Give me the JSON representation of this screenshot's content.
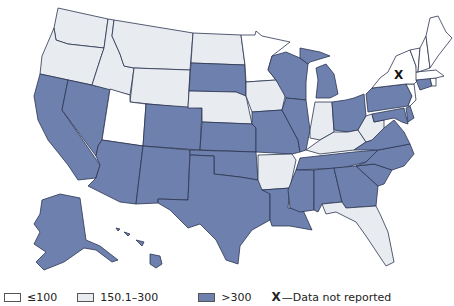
{
  "colors": {
    "le100": "#ffffff",
    "mid": "#e8ebf0",
    "gt300": "#6e80ad",
    "border": "#2b3550"
  },
  "legend": {
    "items": [
      {
        "label": "≤100",
        "color": "#ffffff"
      },
      {
        "label": "150.1–300",
        "color": "#e8ebf0"
      },
      {
        "label": ">300",
        "color": "#6e80ad"
      }
    ],
    "no_data_symbol": "X",
    "no_data_label": "—Data not reported"
  },
  "map": {
    "no_data_marker": "X",
    "categories": {
      "le100": [
        "Minnesota",
        "Utah",
        "New Hampshire",
        "Vermont",
        "Maine",
        "Massachusetts",
        "New Jersey",
        "Rhode Island"
      ],
      "mid": [
        "Washington",
        "Oregon",
        "Idaho",
        "Montana",
        "Wyoming",
        "North Dakota",
        "Nebraska",
        "Iowa",
        "Indiana",
        "West Virginia",
        "Kentucky",
        "Arkansas",
        "Florida"
      ],
      "gt300": [
        "California",
        "Nevada",
        "Arizona",
        "Colorado",
        "New Mexico",
        "South Dakota",
        "Kansas",
        "Oklahoma",
        "Texas",
        "Missouri",
        "Wisconsin",
        "Illinois",
        "Michigan",
        "Ohio",
        "Pennsylvania",
        "Tennessee",
        "Louisiana",
        "Mississippi",
        "Alabama",
        "Georgia",
        "South Carolina",
        "North Carolina",
        "Virginia",
        "Maryland",
        "Delaware",
        "Connecticut",
        "Alaska",
        "Hawaii"
      ],
      "no_data": [
        "New York"
      ]
    }
  }
}
